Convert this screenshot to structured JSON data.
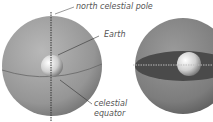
{
  "diagram": {
    "labels": {
      "pole": "north celestial pole",
      "earth": "Earth",
      "equator_line1": "celestial",
      "equator_line2": "equator"
    },
    "colors": {
      "sphere": "#9a9a9a",
      "sphere_dark": "#6e6e6e",
      "equator_plane": "#4a4a4a",
      "earth": "#e0e0e0",
      "label_text": "#555555"
    }
  }
}
